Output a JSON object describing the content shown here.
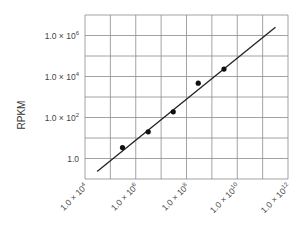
{
  "chart_data": {
    "type": "scatter",
    "title": "",
    "xlabel": "",
    "ylabel": "RPKM",
    "xscale": "log",
    "yscale": "log",
    "xlim": [
      10000.0,
      1000000000000.0
    ],
    "ylim": [
      0.1,
      10000000.0
    ],
    "grid": true,
    "legend": null,
    "x_ticks": [
      {
        "base": "1.0 × 10",
        "exp": "4",
        "value": 10000.0
      },
      {
        "base": "1.0 × 10",
        "exp": "6",
        "value": 1000000.0
      },
      {
        "base": "1.0 × 10",
        "exp": "8",
        "value": 100000000.0
      },
      {
        "base": "1.0 × 10",
        "exp": "10",
        "value": 10000000000.0
      },
      {
        "base": "1.0 × 10",
        "exp": "12",
        "value": 1000000000000.0
      }
    ],
    "y_ticks": [
      {
        "base": "1.0",
        "exp": "",
        "value": 1
      },
      {
        "base": "1.0 × 10",
        "exp": "2",
        "value": 100.0
      },
      {
        "base": "1.0 × 10",
        "exp": "4",
        "value": 10000.0
      },
      {
        "base": "1.0 × 10",
        "exp": "6",
        "value": 1000000.0
      }
    ],
    "series": [
      {
        "name": "data",
        "kind": "points",
        "x": [
          300000.0,
          3100000.0,
          30000000.0,
          290000000.0,
          3000000000.0
        ],
        "y": [
          3.4,
          20,
          190,
          4700,
          23000
        ]
      },
      {
        "name": "fit",
        "kind": "line",
        "x": [
          30000.0,
          320000000000.0
        ],
        "y": [
          0.23,
          2500000.0
        ]
      }
    ]
  },
  "colors": {
    "grid": "#8c8c8c",
    "points": "#111111",
    "line": "#222222",
    "text": "#444444"
  }
}
